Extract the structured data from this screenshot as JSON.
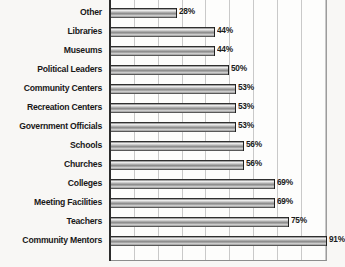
{
  "chart_data": {
    "type": "bar",
    "orientation": "horizontal",
    "title": "",
    "subtitle": "",
    "xlabel": "",
    "ylabel": "",
    "xlim": [
      0,
      100
    ],
    "grid": true,
    "grid_axis": "x",
    "gridline_interval": 10,
    "legend": false,
    "value_suffix": "%",
    "categories": [
      "Other",
      "Libraries",
      "Museums",
      "Political Leaders",
      "Community Centers",
      "Recreation Centers",
      "Government Officials",
      "Schools",
      "Churches",
      "Colleges",
      "Meeting Facilities",
      "Teachers",
      "Community Mentors"
    ],
    "values": [
      28,
      44,
      44,
      50,
      53,
      53,
      53,
      56,
      56,
      69,
      69,
      75,
      91
    ],
    "data_labels": [
      "28%",
      "44%",
      "44%",
      "50%",
      "53%",
      "53%",
      "53%",
      "56%",
      "56%",
      "69%",
      "69%",
      "75%",
      "91%"
    ],
    "colors": {
      "bar_dark": "#1d1d1d",
      "bar_mid": "#8e8e8e",
      "bar_light": "#efefef",
      "gridline": "#c9c9c9",
      "axis": "#2c2c2c",
      "plot_background": "#fdfdfc",
      "page_background": "#f8f7f5",
      "text": "#181818"
    }
  }
}
